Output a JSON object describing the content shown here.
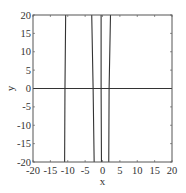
{
  "chart_data": {
    "type": "line",
    "title": "",
    "xlabel": "x",
    "ylabel": "y",
    "xlim": [
      -20,
      20
    ],
    "ylim": [
      -20,
      20
    ],
    "grid": false,
    "legend": null,
    "x_ticks": [
      -20,
      -15,
      -10,
      -5,
      0,
      5,
      10,
      15,
      20
    ],
    "y_ticks": [
      -20,
      -15,
      -10,
      -5,
      0,
      5,
      10,
      15,
      20
    ],
    "x_tick_labels": [
      "-20",
      "-15",
      "-10",
      "-5",
      "0",
      "5",
      "10",
      "15",
      "20"
    ],
    "y_tick_labels": [
      "-20",
      "-15",
      "-10",
      "-5",
      "0",
      "5",
      "10",
      "15",
      "20"
    ],
    "series": [
      {
        "name": "y=f(x) branch near x=-10.8",
        "points": [
          [
            -10.6,
            20
          ],
          [
            -10.8,
            0
          ],
          [
            -10.9,
            -20
          ]
        ]
      },
      {
        "name": "y=f(x) branch near x=-2.7",
        "points": [
          [
            -3.1,
            20
          ],
          [
            -2.7,
            0
          ],
          [
            -2.4,
            -20
          ]
        ]
      },
      {
        "name": "y=f(x) branch near x=-0.4",
        "points": [
          [
            -0.4,
            20
          ],
          [
            -0.4,
            0
          ],
          [
            -0.3,
            -20
          ]
        ]
      },
      {
        "name": "y=f(x) branch near x=1.9",
        "points": [
          [
            1.8,
            -20
          ],
          [
            1.9,
            0
          ],
          [
            2.3,
            20
          ]
        ]
      },
      {
        "name": "y=0 axis line",
        "points": [
          [
            -20,
            0
          ],
          [
            20,
            0
          ]
        ]
      }
    ],
    "line_color": "#333333"
  },
  "plot_area": {
    "left": 33,
    "top": 15,
    "right": 172,
    "bottom": 162
  }
}
